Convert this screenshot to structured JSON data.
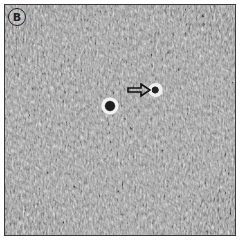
{
  "figure": {
    "panel_label": "B",
    "annotations": [
      {
        "type": "arrow",
        "direction": "right",
        "target": "rounded bright cell"
      }
    ],
    "colors": {
      "background": "#9a9a9a",
      "border": "#3a3a3a",
      "arrow": "#111111"
    }
  }
}
